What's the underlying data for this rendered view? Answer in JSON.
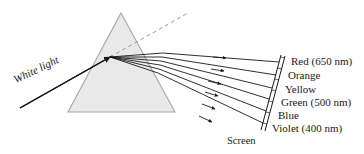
{
  "figure": {
    "background_color": "#ffffff",
    "ink_color": "#1a1a1a",
    "prism_fill": "#e8e8e8",
    "prism_stroke": "#a0a0a0",
    "dashed_color": "#9a9a9a"
  },
  "source_label": {
    "text": "White light",
    "rotation_deg": -26
  },
  "screen": {
    "label": "Screen"
  },
  "spectrum": [
    {
      "name": "Red (650 nm)",
      "color_name": "red",
      "wavelength_nm": 650,
      "swatch": "#d32020"
    },
    {
      "name": "Orange",
      "color_name": "orange",
      "wavelength_nm": null,
      "swatch": "#e07b20"
    },
    {
      "name": "Yellow",
      "color_name": "yellow",
      "wavelength_nm": null,
      "swatch": "#e8d020"
    },
    {
      "name": "Green (500 nm)",
      "color_name": "green",
      "wavelength_nm": 500,
      "swatch": "#2f9e3f"
    },
    {
      "name": "Blue",
      "color_name": "blue",
      "wavelength_nm": null,
      "swatch": "#2050c0"
    },
    {
      "name": "Violet (400 nm)",
      "color_name": "violet",
      "wavelength_nm": 400,
      "swatch": "#7a30b0"
    }
  ]
}
